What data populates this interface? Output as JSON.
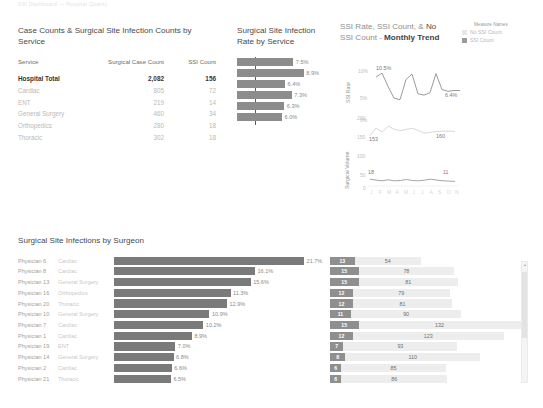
{
  "header": {
    "ghost_text": "SSI Dashboard — Hospital Quality"
  },
  "service_panel": {
    "title": "Case Counts & Surgical Site Infection Counts by Service",
    "columns": [
      "Service",
      "Surgical Case Count",
      "SSI Count"
    ],
    "rows": [
      {
        "service": "Hospital Total",
        "cases": "2,082",
        "ssi": "156",
        "total": true
      },
      {
        "service": "Cardiac",
        "cases": "805",
        "ssi": "72",
        "total": false
      },
      {
        "service": "ENT",
        "cases": "219",
        "ssi": "14",
        "total": false
      },
      {
        "service": "General Surgery",
        "cases": "460",
        "ssi": "34",
        "total": false
      },
      {
        "service": "Orthopedics",
        "cases": "280",
        "ssi": "18",
        "total": false
      },
      {
        "service": "Thoracic",
        "cases": "302",
        "ssi": "18",
        "total": false
      }
    ]
  },
  "rate_panel": {
    "title": "Surgical Site Infection Rate by Service",
    "bars": [
      {
        "label": "7.5%",
        "value": 7.5
      },
      {
        "label": "8.9%",
        "value": 8.9
      },
      {
        "label": "6.4%",
        "value": 6.4
      },
      {
        "label": "7.3%",
        "value": 7.3
      },
      {
        "label": "6.3%",
        "value": 6.3
      },
      {
        "label": "6.0%",
        "value": 6.0
      }
    ],
    "reference_line": 2.4,
    "axis_max": 9.6
  },
  "trend_panel": {
    "title_part1": "SSI Rate, SSI Count, & ",
    "title_part2": "No",
    "title_part3": "SSI Count - ",
    "title_bold": "Monthly Trend",
    "legend_title": "Measure Names",
    "legend": [
      {
        "label": "No SSI Count",
        "color": "#e8e8e8"
      },
      {
        "label": "SSI Count",
        "color": "#9a9a9a"
      }
    ],
    "rate_chart": {
      "ylabel": "SSI Rate",
      "yticks": [
        "10%",
        "5%",
        "0%"
      ],
      "peak_label": "10.5%",
      "end_label": "6.4%",
      "values": [
        9.6,
        10.5,
        7.4,
        4.6,
        4.2,
        9.0,
        10.3,
        5.6,
        5.3,
        5.9,
        10.4,
        6.6,
        6.2,
        6.4,
        6.4
      ]
    },
    "volume_chart": {
      "ylabel": "Surgical Volume",
      "yticks": [
        "200",
        "150",
        "100",
        "50",
        "0"
      ],
      "volume_start_label": "153",
      "volume_mid_label": "160",
      "ssi_start_label": "18",
      "ssi_end_label": "11",
      "volume_values": [
        153,
        176,
        163,
        182,
        172,
        168,
        172,
        175,
        168,
        160,
        163,
        165,
        166,
        166,
        166
      ],
      "ssi_values": [
        18,
        15,
        13,
        16,
        13,
        14,
        17,
        14,
        13,
        15,
        18,
        15,
        13,
        12,
        11
      ],
      "xticks": [
        "J",
        "F",
        "M",
        "A",
        "M",
        "J",
        "J",
        "A",
        "S",
        "O",
        "N"
      ]
    }
  },
  "surgeon_panel": {
    "title": "Surgical Site Infections by Surgeon",
    "rows": [
      {
        "name": "Physician 6",
        "service": "Cardiac",
        "pct": "21.7%",
        "pct_value": 21.7,
        "ssi_count": "13",
        "nossi_count": "54"
      },
      {
        "name": "Physician 8",
        "service": "Cardiac",
        "pct": "16.1%",
        "pct_value": 16.1,
        "ssi_count": "15",
        "nossi_count": "78"
      },
      {
        "name": "Physician 13",
        "service": "General Surgery",
        "pct": "15.6%",
        "pct_value": 15.6,
        "ssi_count": "15",
        "nossi_count": "81"
      },
      {
        "name": "Physician 16",
        "service": "Orthopedics",
        "pct": "11.3%",
        "pct_value": 13.3,
        "ssi_count": "12",
        "nossi_count": "79"
      },
      {
        "name": "Physician 20",
        "service": "Thoracic",
        "pct": "12.9%",
        "pct_value": 12.9,
        "ssi_count": "12",
        "nossi_count": "81"
      },
      {
        "name": "Physician 10",
        "service": "General Surgery",
        "pct": "10.9%",
        "pct_value": 10.9,
        "ssi_count": "11",
        "nossi_count": "90"
      },
      {
        "name": "Physician 7",
        "service": "Cardiac",
        "pct": "10.2%",
        "pct_value": 10.2,
        "ssi_count": "15",
        "nossi_count": "132"
      },
      {
        "name": "Physician 1",
        "service": "Cardiac",
        "pct": "8.9%",
        "pct_value": 8.9,
        "ssi_count": "12",
        "nossi_count": "123"
      },
      {
        "name": "Physician 19",
        "service": "ENT",
        "pct": "7.0%",
        "pct_value": 7.0,
        "ssi_count": "7",
        "nossi_count": "93"
      },
      {
        "name": "Physician 14",
        "service": "General Surgery",
        "pct": "6.8%",
        "pct_value": 6.8,
        "ssi_count": "8",
        "nossi_count": "110"
      },
      {
        "name": "Physician 2",
        "service": "Cardiac",
        "pct": "6.6%",
        "pct_value": 6.6,
        "ssi_count": "6",
        "nossi_count": "85"
      },
      {
        "name": "Physician 21",
        "service": "Thoracic",
        "pct": "6.5%",
        "pct_value": 6.5,
        "ssi_count": "6",
        "nossi_count": "86"
      }
    ]
  },
  "chart_data": {
    "type": "bar",
    "title": "SSI Dashboard",
    "charts": [
      {
        "type": "table",
        "title": "Case Counts & Surgical Site Infection Counts by Service",
        "columns": [
          "Service",
          "Surgical Case Count",
          "SSI Count"
        ],
        "rows": [
          [
            "Hospital Total",
            2082,
            156
          ],
          [
            "Cardiac",
            805,
            72
          ],
          [
            "ENT",
            219,
            14
          ],
          [
            "General Surgery",
            460,
            34
          ],
          [
            "Orthopedics",
            280,
            18
          ],
          [
            "Thoracic",
            302,
            18
          ]
        ]
      },
      {
        "type": "bar",
        "title": "Surgical Site Infection Rate by Service",
        "orientation": "horizontal",
        "categories": [
          "Hospital Total",
          "Cardiac",
          "ENT",
          "General Surgery",
          "Orthopedics",
          "Thoracic"
        ],
        "values": [
          7.5,
          8.9,
          6.4,
          7.3,
          6.3,
          6.0
        ],
        "xlabel": "SSI Rate (%)",
        "ylabel": "",
        "xlim": [
          0,
          9.6
        ],
        "reference_line": 2.4,
        "grid": false
      },
      {
        "type": "line",
        "title": "SSI Rate, SSI Count, & No SSI Count - Monthly Trend",
        "ylabel": "SSI Rate",
        "ylim": [
          0,
          12
        ],
        "yticks": [
          0,
          5,
          10
        ],
        "values": [
          9.6,
          10.5,
          7.4,
          4.6,
          4.2,
          9.0,
          10.3,
          5.6,
          5.3,
          5.9,
          10.4,
          6.6,
          6.2,
          6.4,
          6.4
        ],
        "annotations": [
          {
            "label": "10.5%",
            "index": 1
          },
          {
            "label": "6.4%",
            "index": 13
          }
        ],
        "grid": false
      },
      {
        "type": "line",
        "title": "Surgical Volume Monthly Trend",
        "ylabel": "Surgical Volume",
        "ylim": [
          0,
          200
        ],
        "yticks": [
          0,
          50,
          100,
          150,
          200
        ],
        "series": [
          {
            "name": "Surgical Volume",
            "values": [
              153,
              176,
              163,
              182,
              172,
              168,
              172,
              175,
              168,
              160,
              163,
              165,
              166,
              166,
              166
            ]
          },
          {
            "name": "SSI Count",
            "values": [
              18,
              15,
              13,
              16,
              13,
              14,
              17,
              14,
              13,
              15,
              18,
              15,
              13,
              12,
              11
            ]
          }
        ],
        "annotations": [
          {
            "label": "153",
            "index": 0
          },
          {
            "label": "160",
            "index": 9
          },
          {
            "label": "18",
            "index": 0
          },
          {
            "label": "11",
            "index": 14
          }
        ],
        "grid": false
      },
      {
        "type": "bar",
        "title": "Surgical Site Infections by Surgeon",
        "orientation": "horizontal",
        "categories": [
          "Physician 6",
          "Physician 8",
          "Physician 13",
          "Physician 16",
          "Physician 20",
          "Physician 10",
          "Physician 7",
          "Physician 1",
          "Physician 19",
          "Physician 14",
          "Physician 2",
          "Physician 21"
        ],
        "series": [
          {
            "name": "SSI Rate %",
            "values": [
              21.7,
              16.1,
              15.6,
              13.3,
              12.9,
              10.9,
              10.2,
              8.9,
              7.0,
              6.8,
              6.6,
              6.5
            ]
          },
          {
            "name": "SSI Count",
            "values": [
              13,
              15,
              15,
              12,
              12,
              11,
              15,
              12,
              7,
              8,
              6,
              6
            ]
          },
          {
            "name": "No SSI Count",
            "values": [
              54,
              78,
              81,
              79,
              81,
              90,
              132,
              123,
              93,
              110,
              85,
              86
            ]
          }
        ],
        "grid": false
      }
    ]
  }
}
